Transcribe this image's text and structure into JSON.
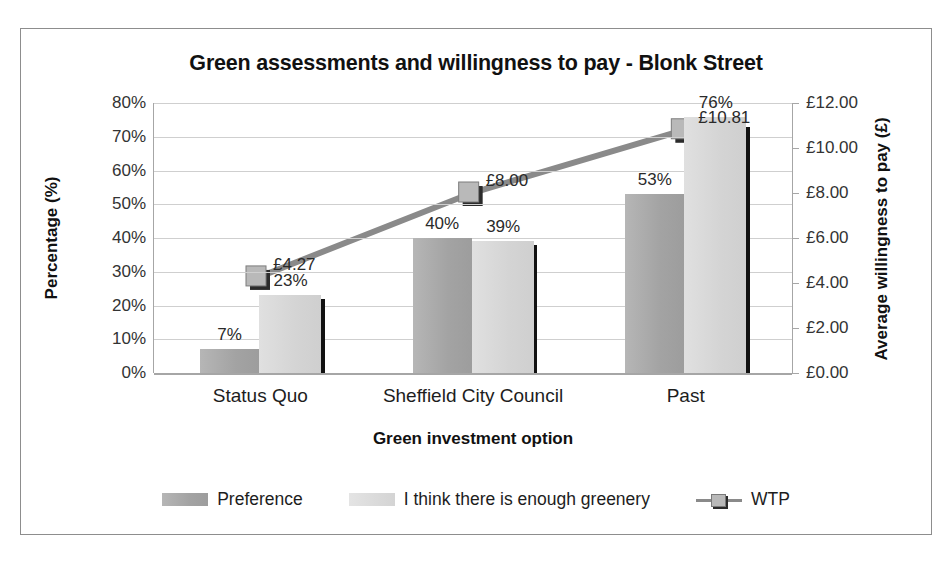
{
  "chart_data": {
    "type": "bar",
    "title": "Green assessments and willingness to pay - Blonk Street",
    "xlabel": "Green investment option",
    "ylabel": "Percentage (%)",
    "y2label": "Average willingness to pay (£)",
    "categories": [
      "Status Quo",
      "Sheffield City Council",
      "Past"
    ],
    "ylim": [
      0,
      80
    ],
    "y2lim": [
      0,
      12
    ],
    "grid": true,
    "legend_position": "bottom",
    "y_ticks": [
      "0%",
      "10%",
      "20%",
      "30%",
      "40%",
      "50%",
      "60%",
      "70%",
      "80%"
    ],
    "y_tick_values": [
      0,
      10,
      20,
      30,
      40,
      50,
      60,
      70,
      80
    ],
    "y2_ticks": [
      "£0.00",
      "£2.00",
      "£4.00",
      "£6.00",
      "£8.00",
      "£10.00",
      "£12.00"
    ],
    "y2_tick_values": [
      0,
      2,
      4,
      6,
      8,
      10,
      12
    ],
    "series": [
      {
        "name": "Preference",
        "type": "bar",
        "axis": "left",
        "color": "#a3a3a3",
        "values": [
          7,
          40,
          53
        ],
        "labels": [
          "7%",
          "40%",
          "53%"
        ]
      },
      {
        "name": "I think there is enough greenery",
        "type": "bar",
        "axis": "left",
        "color": "#d4d4d4",
        "values": [
          23,
          39,
          76
        ],
        "labels": [
          "23%",
          "39%",
          "76%"
        ]
      },
      {
        "name": "WTP",
        "type": "line",
        "axis": "right",
        "color": "#8a8a8a",
        "values": [
          4.27,
          8.0,
          10.81
        ],
        "labels": [
          "£4.27",
          "£8.00",
          "£10.81"
        ]
      }
    ],
    "error_bars": {
      "name": "error-bar",
      "color": "#111111",
      "axis": "left",
      "values": [
        22,
        38,
        73
      ]
    }
  },
  "legend": {
    "items": [
      {
        "label": "Preference",
        "swatch": "pref-swatch"
      },
      {
        "label": "I think there is enough greenery",
        "swatch": "greenery-swatch"
      },
      {
        "label": "WTP",
        "swatch": "wtp-marker"
      }
    ]
  }
}
